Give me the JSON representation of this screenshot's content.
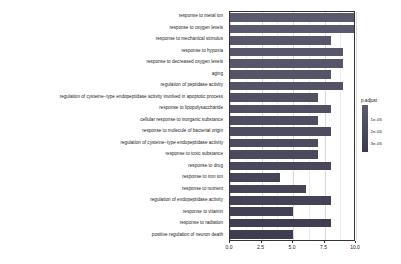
{
  "chart_data": {
    "type": "bar",
    "title": "",
    "xlabel": "",
    "ylabel": "",
    "orientation": "horizontal",
    "xlim": [
      0,
      10
    ],
    "grid": true,
    "xticks": [
      "0.0",
      "2.5",
      "5.0",
      "7.5",
      "10.0"
    ],
    "xtick_values": [
      0,
      2.5,
      5,
      7.5,
      10
    ],
    "categories": [
      "response to metal ion",
      "response to oxygen levels",
      "response to mechanical stimulus",
      "response to hypoxia",
      "response to decreased oxygen levels",
      "aging",
      "regulation of peptidase activity",
      "regulation of cysteine−type endopeptidase activity involved in apoptotic process",
      "response to lipopolysaccharide",
      "cellular response to inorganic substance",
      "response to molecule of bacterial origin",
      "regulation of cysteine−type endopeptidase activity",
      "response to toxic substance",
      "response to drug",
      "response to iron ion",
      "response to nutrient",
      "regulation of endopeptidase activity",
      "response to vitamin",
      "response to radiation",
      "positive regulation of neuron death"
    ],
    "values": [
      10,
      10,
      8,
      9,
      9,
      8,
      9,
      7,
      8,
      7,
      8,
      7,
      7,
      8,
      4,
      6,
      8,
      5,
      8,
      5
    ],
    "bar_colors": [
      "#5a5a6e",
      "#5a5a6e",
      "#575769",
      "#575769",
      "#565668",
      "#545466",
      "#535365",
      "#515163",
      "#505062",
      "#4e4e60",
      "#4d4d5f",
      "#4b4b5d",
      "#4a4a5c",
      "#48485a",
      "#464658",
      "#454557",
      "#434355",
      "#414153",
      "#3f3f51",
      "#3d3d4f"
    ],
    "legend": {
      "title": "p.adjust",
      "position": "right",
      "type": "colorbar",
      "ticks": [
        "1e-05",
        "2e-05",
        "3e-05"
      ],
      "tick_positions": [
        0.3,
        0.55,
        0.8
      ],
      "gradient_top": "#5c5c70",
      "gradient_bottom": "#3b3b4d"
    }
  }
}
